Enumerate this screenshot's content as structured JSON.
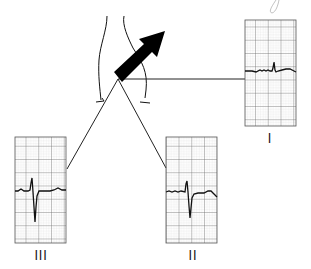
{
  "diagram": {
    "type": "ecg-lead-axis-diagram",
    "colors": {
      "grid_fine": "#c8c8c8",
      "grid_major": "#555555",
      "trace": "#111111",
      "line": "#222222",
      "arrow": "#000000"
    },
    "leads": [
      {
        "id": "I",
        "label": "I",
        "box": {
          "x": 245,
          "y": 20,
          "w": 51,
          "h": 106
        },
        "label_pos": {
          "x": 262,
          "y": 130
        }
      },
      {
        "id": "II",
        "label": "II",
        "box": {
          "x": 166,
          "y": 137,
          "w": 51,
          "h": 106
        },
        "label_pos": {
          "x": 183,
          "y": 247
        }
      },
      {
        "id": "III",
        "label": "III",
        "box": {
          "x": 15,
          "y": 137,
          "w": 51,
          "h": 106
        },
        "label_pos": {
          "x": 30,
          "y": 247
        }
      }
    ],
    "connector_origin": {
      "x": 118,
      "y": 78
    },
    "axis_arrow": {
      "from": {
        "x": 118,
        "y": 78
      },
      "to": {
        "x": 165,
        "y": 31
      },
      "label": "mean electrical axis"
    }
  }
}
